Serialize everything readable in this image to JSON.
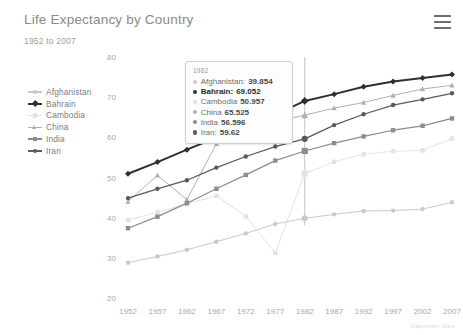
{
  "header": {
    "title": "Life Expectancy by Country",
    "subtitle": "1952 to 2007",
    "menu_icon": "hamburger-menu-icon"
  },
  "attribution": "Gapminder Data",
  "tooltip": {
    "year": "1982",
    "rows": [
      {
        "name": "Afghanistan:",
        "value": "39.854",
        "color": "#c9c9c9",
        "emphasis": false
      },
      {
        "name": "Bahrain:",
        "value": "69.052",
        "color": "#2f2f2f",
        "emphasis": true
      },
      {
        "name": "Cambodia",
        "value": "50.957",
        "color": "#e0e0e0",
        "emphasis": false
      },
      {
        "name": "China",
        "value": "65.525",
        "color": "#b0b0b0",
        "emphasis": false
      },
      {
        "name": "India",
        "value": "56.596",
        "color": "#8d8d8d",
        "emphasis": false
      },
      {
        "name": "Iran:",
        "value": "59.62",
        "color": "#5a5a5a",
        "emphasis": false
      }
    ]
  },
  "legend": {
    "items": [
      {
        "label": "Afghanistan",
        "color": "#c9c9c9"
      },
      {
        "label": "Bahrain",
        "color": "#2f2f2f"
      },
      {
        "label": "Cambodia",
        "color": "#e3e3e3"
      },
      {
        "label": "China",
        "color": "#b0b0b0"
      },
      {
        "label": "India",
        "color": "#8d8d8d"
      },
      {
        "label": "Iran",
        "color": "#5a5a5a"
      }
    ]
  },
  "chart_data": {
    "type": "line",
    "title": "Life Expectancy by Country",
    "subtitle": "1952 to 2007",
    "xlabel": "",
    "ylabel": "",
    "xlim": [
      1952,
      2007
    ],
    "ylim": [
      20,
      80
    ],
    "grid": false,
    "legend_position": "left",
    "x": [
      1952,
      1957,
      1962,
      1967,
      1972,
      1977,
      1982,
      1987,
      1992,
      1997,
      2002,
      2007
    ],
    "xtick_labels": [
      "1952",
      "1957",
      "1962",
      "1967",
      "1972",
      "1977",
      "1982",
      "1987",
      "1992",
      "1997",
      "2002",
      "2007"
    ],
    "ytick_labels": [
      "20",
      "30",
      "40",
      "50",
      "60",
      "70",
      "80"
    ],
    "yticks": [
      20,
      30,
      40,
      50,
      60,
      70,
      80
    ],
    "hover_year": 1982,
    "series": [
      {
        "name": "Afghanistan",
        "color": "#c9c9c9",
        "marker": "circle",
        "values": [
          28.801,
          30.332,
          31.997,
          34.02,
          36.088,
          38.438,
          39.854,
          40.822,
          41.674,
          41.763,
          42.129,
          43.828
        ]
      },
      {
        "name": "Bahrain",
        "color": "#2f2f2f",
        "marker": "diamond",
        "values": [
          50.939,
          53.832,
          56.923,
          59.923,
          63.3,
          65.593,
          69.052,
          70.75,
          72.601,
          73.925,
          74.795,
          75.635
        ]
      },
      {
        "name": "Cambodia",
        "color": "#e3e3e3",
        "marker": "square",
        "values": [
          39.417,
          41.366,
          43.415,
          45.415,
          40.317,
          31.22,
          50.957,
          53.914,
          55.803,
          56.534,
          56.752,
          59.723
        ]
      },
      {
        "name": "China",
        "color": "#b0b0b0",
        "marker": "triangle-up",
        "values": [
          44.0,
          50.54896,
          44.50136,
          58.38112,
          63.11888,
          63.96736,
          65.525,
          67.274,
          68.69,
          70.426,
          72.028,
          72.961
        ]
      },
      {
        "name": "India",
        "color": "#8d8d8d",
        "marker": "square",
        "values": [
          37.373,
          40.249,
          43.605,
          47.193,
          50.651,
          54.208,
          56.596,
          58.553,
          60.223,
          61.765,
          62.879,
          64.698
        ]
      },
      {
        "name": "Iran",
        "color": "#5a5a5a",
        "marker": "circle",
        "values": [
          44.869,
          47.181,
          49.325,
          52.469,
          55.234,
          57.702,
          59.62,
          63.04,
          65.742,
          68.042,
          69.451,
          70.964
        ]
      }
    ]
  }
}
